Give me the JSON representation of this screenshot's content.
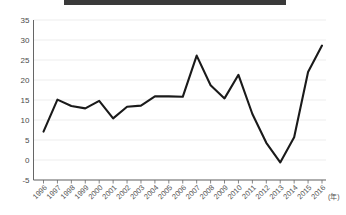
{
  "figure": {
    "title_banner_text": "",
    "source_note": "",
    "background_color": "#ffffff"
  },
  "chart_data": {
    "type": "line",
    "title": "",
    "xlabel": "(年)",
    "ylabel": "",
    "categories": [
      "1996",
      "1997",
      "1998",
      "1999",
      "2000",
      "2001",
      "2002",
      "2003",
      "2004",
      "2005",
      "2006",
      "2007",
      "2008",
      "2009",
      "2010",
      "2011",
      "2012",
      "2013",
      "2014",
      "2015",
      "2016"
    ],
    "values": [
      7.1,
      15.1,
      13.5,
      12.9,
      14.8,
      10.4,
      13.3,
      13.6,
      15.9,
      15.9,
      15.8,
      26.1,
      18.7,
      15.4,
      21.3,
      11.5,
      4.3,
      -0.6,
      5.7,
      22.0,
      28.6
    ],
    "series": [
      {
        "name": "",
        "color": "#1a1a1a",
        "values": [
          7.1,
          15.1,
          13.5,
          12.9,
          14.8,
          10.4,
          13.3,
          13.6,
          15.9,
          15.9,
          15.8,
          26.1,
          18.7,
          15.4,
          21.3,
          11.5,
          4.3,
          -0.6,
          5.7,
          22.0,
          28.6
        ]
      }
    ],
    "ylim": [
      -5,
      35
    ],
    "yticks": [
      35,
      30,
      25,
      20,
      15,
      10,
      5,
      0,
      -5
    ],
    "ytick_labels": [
      "35",
      "30",
      "25",
      "20",
      "15",
      "10",
      "5",
      "0",
      "-5"
    ],
    "xtick_labels": [
      "1996",
      "1997",
      "1998",
      "1999",
      "2000",
      "2001",
      "2002",
      "2003",
      "2004",
      "2005",
      "2006",
      "2007",
      "2008",
      "2009",
      "2010",
      "2011",
      "2012",
      "2013",
      "2014",
      "2015",
      "2016"
    ],
    "grid": true,
    "grid_color": "#e8e8e8",
    "legend": false,
    "legend_position": "none",
    "line_color": "#1a1a1a",
    "axis_color": "#666666",
    "xlabel_rotation": -45
  }
}
